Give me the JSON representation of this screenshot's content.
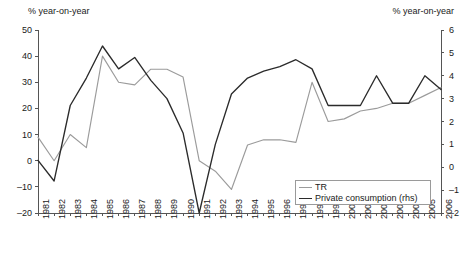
{
  "chart_data": {
    "type": "line",
    "title": "",
    "subtitle": "",
    "xlabel": "",
    "ylabel": "% year-on-year",
    "ylabel_right": "% year-on-year",
    "grid": false,
    "legend_position": "bottom-right",
    "x": [
      1981,
      1982,
      1983,
      1984,
      1985,
      1986,
      1987,
      1988,
      1989,
      1990,
      1991,
      1992,
      1993,
      1994,
      1995,
      1996,
      1997,
      1998,
      1999,
      2000,
      2001,
      2002,
      2003,
      2004,
      2005,
      2006
    ],
    "xtick_labels": [
      "1981",
      "1982",
      "1983",
      "1984",
      "1985",
      "1986",
      "1987",
      "1988",
      "1989",
      "1990",
      "1991",
      "1992",
      "1993",
      "1994",
      "1995",
      "1996",
      "1997",
      "1998",
      "1999",
      "2000",
      "2001",
      "2002",
      "2003",
      "2004",
      "2005",
      "2006"
    ],
    "ylim": [
      -20,
      50
    ],
    "ytick_labels": [
      "50",
      "40",
      "30",
      "20",
      "10",
      "0",
      "-10",
      "-20"
    ],
    "ytick_values": [
      50,
      40,
      30,
      20,
      10,
      0,
      -10,
      -20
    ],
    "ylim_right": [
      -2,
      6
    ],
    "ytick_labels_right": [
      "6",
      "5",
      "4",
      "3",
      "2",
      "1",
      "0",
      "-1",
      "-2"
    ],
    "ytick_values_right": [
      6,
      5,
      4,
      3,
      2,
      1,
      0,
      -1,
      -2
    ],
    "series": [
      {
        "name": "TR",
        "axis": "left",
        "color": "#9b9b9b",
        "values": [
          9,
          0,
          10,
          5,
          40,
          30,
          29,
          35,
          35,
          32,
          0,
          -4,
          -11,
          6,
          8,
          8,
          7,
          30,
          15,
          16,
          19,
          20,
          22,
          22,
          25,
          28
        ]
      },
      {
        "name": "Private consumption (rhs)",
        "axis": "right",
        "color": "#2b2b2b",
        "values": [
          0.3,
          -0.6,
          2.7,
          3.9,
          5.3,
          4.3,
          4.8,
          3.8,
          3.0,
          1.5,
          -2.0,
          1.0,
          3.2,
          3.9,
          4.2,
          4.4,
          4.7,
          4.3,
          2.7,
          2.7,
          2.7,
          4.0,
          2.8,
          2.8,
          4.0,
          3.4
        ]
      }
    ]
  },
  "legend": {
    "entries": [
      {
        "label": "TR",
        "color": "#9b9b9b"
      },
      {
        "label": "Private consumption (rhs)",
        "color": "#2b2b2b"
      }
    ]
  },
  "axes": {
    "left_title": "% year-on-year",
    "right_title": "% year-on-year"
  }
}
